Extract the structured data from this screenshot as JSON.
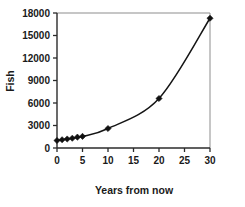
{
  "chart_data": {
    "type": "line",
    "title": "",
    "xlabel": "Years from now",
    "ylabel": "Fish",
    "xlim": [
      0,
      30
    ],
    "ylim": [
      0,
      18000
    ],
    "xticks": [
      0,
      5,
      10,
      15,
      20,
      25,
      30
    ],
    "xtick_labels": [
      "0",
      "5",
      "10",
      "15",
      "20",
      "25",
      "30"
    ],
    "yticks": [
      0,
      3000,
      6000,
      9000,
      12000,
      15000,
      18000
    ],
    "ytick_labels": [
      "0",
      "3000",
      "6000",
      "9000",
      "12000",
      "15000",
      "18000"
    ],
    "grid": false,
    "legend": null,
    "marker": "diamond",
    "series": [
      {
        "name": "Fish population",
        "x": [
          0,
          1,
          2,
          3,
          4,
          5,
          10,
          20,
          30
        ],
        "values": [
          1000,
          1100,
          1200,
          1300,
          1450,
          1550,
          2600,
          6600,
          17300
        ]
      }
    ]
  },
  "axes": {
    "y_title": "Fish",
    "x_title": "Years from now"
  },
  "colors": {
    "line": "#151515",
    "marker": "#101010",
    "axis": "#2b2b2b",
    "border": "#8d8d8d",
    "background": "#ffffff"
  }
}
